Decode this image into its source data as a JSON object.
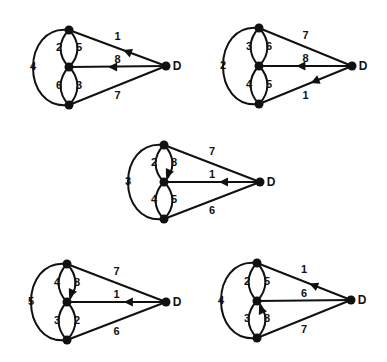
{
  "figure": {
    "diagrams": [
      {
        "id": "g1",
        "nodes": {
          "top": [
            69,
            30
          ],
          "mid": [
            69,
            67
          ],
          "bot": [
            69,
            105
          ],
          "D": [
            166,
            66
          ]
        },
        "d_label": "D",
        "outer_label": "4",
        "inner_upper_left": "2",
        "inner_upper_right": "5",
        "inner_lower_left": "6",
        "inner_lower_right": "3",
        "edge_top_D": "1",
        "edge_mid_D": "8",
        "edge_bot_D": "7",
        "arrows": [
          "top_D",
          "mid_D"
        ]
      },
      {
        "id": "g2",
        "nodes": {
          "top": [
            259,
            28
          ],
          "mid": [
            259,
            66
          ],
          "bot": [
            259,
            104
          ],
          "D": [
            352,
            66
          ]
        },
        "d_label": "D",
        "outer_label": "2",
        "inner_upper_left": "3",
        "inner_upper_right": "6",
        "inner_lower_left": "4",
        "inner_lower_right": "5",
        "edge_top_D": "7",
        "edge_mid_D": "8",
        "edge_bot_D": "1",
        "arrows": [
          "mid_D",
          "bot_D"
        ]
      },
      {
        "id": "g3",
        "nodes": {
          "top": [
            164,
            145
          ],
          "mid": [
            164,
            182
          ],
          "bot": [
            164,
            219
          ],
          "D": [
            260,
            182
          ]
        },
        "d_label": "D",
        "outer_label": "3",
        "inner_upper_left": "2",
        "inner_upper_right": "8",
        "inner_lower_left": "4",
        "inner_lower_right": "5",
        "edge_top_D": "7",
        "edge_mid_D": "1",
        "edge_bot_D": "6",
        "arrows": [
          "mid_D",
          "upper_right_down"
        ]
      },
      {
        "id": "g4",
        "nodes": {
          "top": [
            67,
            264
          ],
          "mid": [
            67,
            302
          ],
          "bot": [
            67,
            340
          ],
          "D": [
            166,
            302
          ]
        },
        "d_label": "D",
        "outer_label": "5",
        "inner_upper_left": "4",
        "inner_upper_right": "8",
        "inner_lower_left": "3",
        "inner_lower_right": "2",
        "edge_top_D": "7",
        "edge_mid_D": "1",
        "edge_bot_D": "6",
        "arrows": [
          "mid_D",
          "upper_right_down"
        ]
      },
      {
        "id": "g5",
        "nodes": {
          "top": [
            257,
            263
          ],
          "mid": [
            257,
            301
          ],
          "bot": [
            257,
            338
          ],
          "D": [
            351,
            300
          ]
        },
        "d_label": "D",
        "outer_label": "4",
        "inner_upper_left": "2",
        "inner_upper_right": "5",
        "inner_lower_left": "3",
        "inner_lower_right": "8",
        "edge_top_D": "1",
        "edge_mid_D": "6",
        "edge_bot_D": "7",
        "arrows": [
          "top_D",
          "lower_right_up"
        ]
      }
    ]
  }
}
